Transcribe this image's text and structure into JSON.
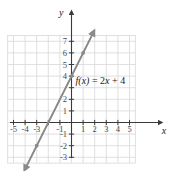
{
  "figure": {
    "background": "#ffffff",
    "grid_color": "#d8d8d8",
    "axis_color": "#3a3a3a",
    "line_color": "#8a8a8a",
    "label_color": "#4a4a4a",
    "x_axis_name": "x",
    "y_axis_name": "y",
    "equation_label": "f(x) = 2x + 4",
    "equation_fx": "f(x)",
    "equation_rest": " = 2",
    "equation_var": "x",
    "equation_tail": " + 4"
  },
  "chart_data": {
    "type": "line",
    "title": "",
    "xlabel": "x",
    "ylabel": "y",
    "equation": "f(x) = 2x + 4",
    "slope": 2,
    "intercept": 4,
    "xlim": [
      -5.5,
      5.5
    ],
    "ylim": [
      -3.5,
      7.5
    ],
    "grid": true,
    "grid_step": 1,
    "legend": "none",
    "x_tick_labels": [
      "-5",
      "-4",
      "-3",
      "",
      "-1",
      "1",
      "2",
      "3",
      "4",
      "5"
    ],
    "x_tick_values": [
      -5,
      -4,
      -3,
      -2,
      -1,
      1,
      2,
      3,
      4,
      5
    ],
    "y_tick_labels": [
      "7",
      "6",
      "5",
      "4",
      "",
      "2",
      "1",
      "-1",
      "-2",
      "-3"
    ],
    "y_tick_values": [
      7,
      6,
      5,
      4,
      3,
      2,
      1,
      -1,
      -2,
      -3
    ],
    "series": [
      {
        "name": "f(x) = 2x + 4",
        "x": [
          -3.9,
          1.8
        ],
        "y": [
          -3.8,
          7.6
        ],
        "arrow_start": true,
        "arrow_end": true
      }
    ],
    "points": [
      {
        "x": -3,
        "y": -2
      },
      {
        "x": 0,
        "y": 4
      },
      {
        "x": 1,
        "y": 6
      }
    ],
    "annotations": [
      {
        "text": "f(x) = 2x + 4",
        "x": 0.35,
        "y": 3.35
      }
    ]
  }
}
